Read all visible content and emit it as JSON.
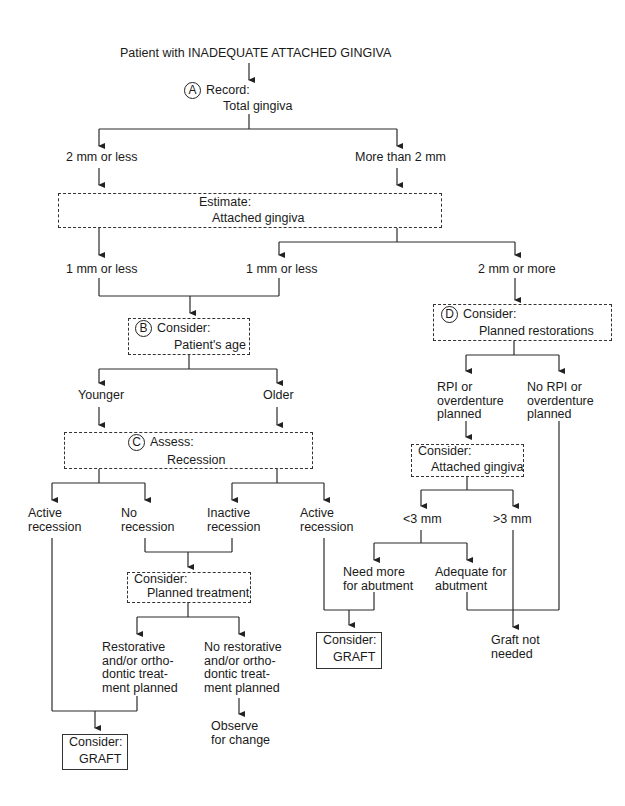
{
  "title": "Patient with INADEQUATE ATTACHED GINGIVA",
  "nodes": {
    "A": {
      "marker": "A",
      "line1": "Record:",
      "line2": "Total gingiva"
    },
    "total_le2": "2 mm or less",
    "total_gt2": "More than 2 mm",
    "estimate": {
      "line1": "Estimate:",
      "line2": "Attached gingiva"
    },
    "att_le1_left": "1 mm or less",
    "att_le1_mid": "1 mm or less",
    "att_ge2": "2 mm or more",
    "B": {
      "marker": "B",
      "line1": "Consider:",
      "line2": "Patient's age"
    },
    "younger": "Younger",
    "older": "Older",
    "C": {
      "marker": "C",
      "line1": "Assess:",
      "line2": "Recession"
    },
    "active_rec_left": {
      "line1": "Active",
      "line2": "recession"
    },
    "no_rec": {
      "line1": "No",
      "line2": "recession"
    },
    "inactive_rec": {
      "line1": "Inactive",
      "line2": "recession"
    },
    "active_rec_right": {
      "line1": "Active",
      "line2": "recession"
    },
    "planned_treatment": {
      "line1": "Consider:",
      "line2": "Planned treatment"
    },
    "restorative": {
      "l1": "Restorative",
      "l2": "and/or ortho-",
      "l3": "dontic treat-",
      "l4": "ment planned"
    },
    "no_restorative": {
      "l1": "No restorative",
      "l2": "and/or ortho-",
      "l3": "dontic treat-",
      "l4": "ment planned"
    },
    "observe": {
      "line1": "Observe",
      "line2": "for change"
    },
    "graft_left": {
      "line1": "Consider:",
      "line2": "GRAFT"
    },
    "D": {
      "marker": "D",
      "line1": "Consider:",
      "line2": "Planned restorations"
    },
    "rpi": {
      "l1": "RPI or",
      "l2": "overdenture",
      "l3": "planned"
    },
    "no_rpi": {
      "l1": "No RPI or",
      "l2": "overdenture",
      "l3": "planned"
    },
    "consider_att": {
      "line1": "Consider:",
      "line2": "Attached gingiva"
    },
    "lt3": "<3 mm",
    "gt3": ">3 mm",
    "need_more": {
      "line1": "Need more",
      "line2": "for abutment"
    },
    "adequate": {
      "line1": "Adequate for",
      "line2": "abutment"
    },
    "graft_mid": {
      "line1": "Consider:",
      "line2": "GRAFT"
    },
    "graft_not": {
      "line1": "Graft not",
      "line2": "needed"
    }
  }
}
